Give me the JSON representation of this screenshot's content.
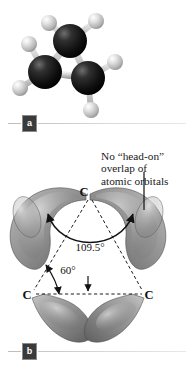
{
  "panel_a": {
    "badge": "a",
    "model": {
      "type": "ball-and-stick",
      "molecule": "cyclopropane",
      "carbon_color": "#111111",
      "hydrogen_color": "#d0d0d0",
      "bond_color": "#c9c9c9",
      "carbons": [
        {
          "id": "C1",
          "cx": 70,
          "cy": 41,
          "r": 16
        },
        {
          "id": "C2",
          "cx": 45,
          "cy": 72,
          "r": 16
        },
        {
          "id": "C3",
          "cx": 88,
          "cy": 78,
          "r": 16
        }
      ],
      "hydrogens": [
        {
          "id": "H1",
          "cx": 96,
          "cy": 21,
          "r": 8
        },
        {
          "id": "H2",
          "cx": 49,
          "cy": 23,
          "r": 8
        },
        {
          "id": "H3",
          "cx": 29,
          "cy": 44,
          "r": 8
        },
        {
          "id": "H4",
          "cx": 20,
          "cy": 88,
          "r": 8
        },
        {
          "id": "H5",
          "cx": 115,
          "cy": 62,
          "r": 8
        },
        {
          "id": "H6",
          "cx": 91,
          "cy": 110,
          "r": 8
        }
      ]
    }
  },
  "panel_b": {
    "badge": "b",
    "annotation": {
      "line1": "No “head-on”",
      "line2": "overlap of",
      "line3": "atomic orbitals"
    },
    "atom_labels": [
      {
        "text": "C",
        "x": 88,
        "y": 45
      },
      {
        "text": "C",
        "x": 24,
        "y": 147
      },
      {
        "text": "C",
        "x": 148,
        "y": 147
      }
    ],
    "angles": [
      {
        "value": "109.5°",
        "x": 73,
        "y": 97,
        "meaning": "ideal sp3 interorbital angle"
      },
      {
        "value": "60°",
        "x": 58,
        "y": 118,
        "meaning": "internal ring angle of cyclopropane"
      }
    ],
    "orbital_color": "#9a9a9a",
    "orbital_highlight": "#d8d8d8",
    "orbital_shadow": "#5d5d5d"
  }
}
